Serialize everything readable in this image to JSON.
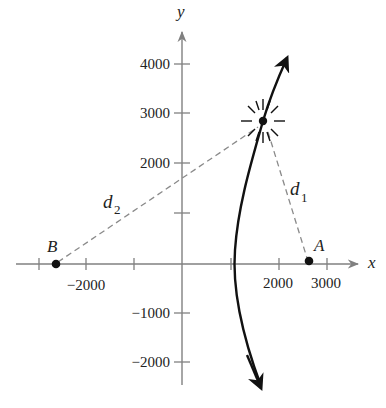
{
  "diagram": {
    "type": "hyperbola-locator",
    "axes": {
      "x_label": "x",
      "y_label": "y",
      "x_tick_labels": [
        {
          "value": -2000,
          "text": "−2000"
        },
        {
          "value": 2000,
          "text": "2000"
        },
        {
          "value": 3000,
          "text": "3000"
        }
      ],
      "y_tick_labels": [
        {
          "value": 4000,
          "text": "4000"
        },
        {
          "value": 3000,
          "text": "3000"
        },
        {
          "value": 2000,
          "text": "2000"
        },
        {
          "value": -1000,
          "text": "−1000"
        },
        {
          "value": -2000,
          "text": "−2000"
        }
      ],
      "x_ticks": [
        -2600,
        -2000,
        -1000,
        1000,
        2000,
        3000
      ],
      "y_ticks": [
        4000,
        3000,
        2000,
        1000,
        -1000,
        -2000
      ]
    },
    "points": {
      "B": {
        "label": "B",
        "x": -2600,
        "y": 0
      },
      "A": {
        "label": "A",
        "x": 2600,
        "y": 0
      },
      "P": {
        "label": "",
        "x": 1700,
        "y": 2900,
        "style": "starburst"
      }
    },
    "distances": {
      "d1": {
        "label": "d",
        "sub": "1",
        "from": "P",
        "to": "A"
      },
      "d2": {
        "label": "d",
        "sub": "2",
        "from": "P",
        "to": "B"
      }
    },
    "colors": {
      "axis": "#808080",
      "curve": "#111111",
      "dashed": "#8a8a8a",
      "point": "#111111",
      "text": "#222222"
    }
  }
}
